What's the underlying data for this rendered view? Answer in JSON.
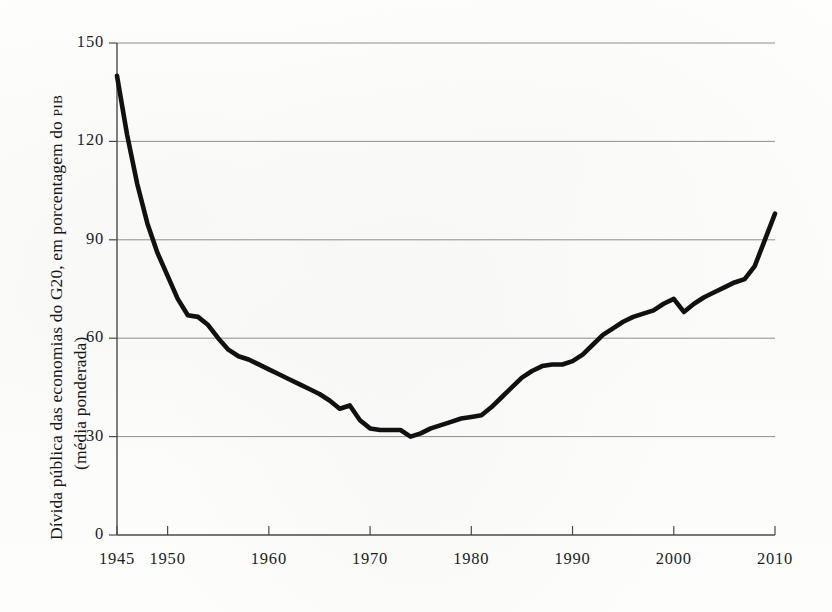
{
  "chart_data": {
    "type": "line",
    "title": "",
    "subtitle": "",
    "xlabel": "",
    "ylabel": "Dívida pública das economias do G20, em porcentagem do PIB (média ponderada)",
    "ylabel_line1": "Dívida pública das economias do G20, em porcentagem do ",
    "ylabel_line1_smallcaps": "PIB",
    "ylabel_line2": "(média ponderada)",
    "xlim": [
      1945,
      2010
    ],
    "ylim": [
      0,
      150
    ],
    "grid": "horizontal",
    "legend": "none",
    "y_ticks": [
      0,
      30,
      60,
      90,
      120,
      150
    ],
    "y_tick_labels": [
      "0",
      "30",
      "60",
      "90",
      "120",
      "150"
    ],
    "x_ticks": [
      1945,
      1950,
      1960,
      1970,
      1980,
      1990,
      2000,
      2010
    ],
    "x_tick_labels": [
      "1945",
      "1950",
      "1960",
      "1970",
      "1980",
      "1990",
      "2000",
      "2010"
    ],
    "series": [
      {
        "name": "Dívida pública G20 (% do PIB)",
        "color": "#111111",
        "x": [
          1945,
          1946,
          1947,
          1948,
          1949,
          1950,
          1951,
          1952,
          1953,
          1954,
          1955,
          1956,
          1957,
          1958,
          1959,
          1960,
          1961,
          1962,
          1963,
          1964,
          1965,
          1966,
          1967,
          1968,
          1969,
          1970,
          1971,
          1972,
          1973,
          1974,
          1975,
          1976,
          1977,
          1978,
          1979,
          1980,
          1981,
          1982,
          1983,
          1984,
          1985,
          1986,
          1987,
          1988,
          1989,
          1990,
          1991,
          1992,
          1993,
          1994,
          1995,
          1996,
          1997,
          1998,
          1999,
          2000,
          2001,
          2002,
          2003,
          2004,
          2005,
          2006,
          2007,
          2008,
          2009,
          2010
        ],
        "values": [
          140,
          122,
          107,
          95,
          86,
          79,
          72,
          67,
          66.5,
          64,
          60,
          56.5,
          54.5,
          53.5,
          52,
          50.5,
          49,
          47.5,
          46,
          44.5,
          43,
          41,
          38.5,
          39.5,
          35,
          32.5,
          32,
          32,
          32,
          30,
          31,
          32.5,
          33.5,
          34.5,
          35.5,
          36,
          36.5,
          39,
          42,
          45,
          48,
          50,
          51.5,
          52,
          52,
          53,
          55,
          58,
          61,
          63,
          65,
          66.5,
          67.5,
          68.5,
          70.5,
          72,
          68,
          70.5,
          72.5,
          74,
          75.5,
          77,
          78,
          82,
          90,
          98
        ]
      }
    ],
    "annotations": []
  },
  "axis": {
    "y_title_part_1": "Dívida pública das economias do G20, em porcentagem do ",
    "y_title_smallcaps": "PIB",
    "y_title_part_2": "(média ponderada)"
  }
}
